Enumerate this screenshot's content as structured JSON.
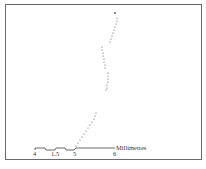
{
  "figure": {
    "border_color": "#6b6b6b",
    "trace_color": "#555555",
    "trace_description": "dotted trajectory rising from lower-left to upper-right",
    "scale_bar": {
      "unit_label": "Millimetres",
      "ticks": [
        {
          "label": "4",
          "x": 35
        },
        {
          "label": "1.5",
          "x": 55
        },
        {
          "label": "5",
          "x": 75
        },
        {
          "label": "6",
          "x": 115
        }
      ]
    }
  }
}
